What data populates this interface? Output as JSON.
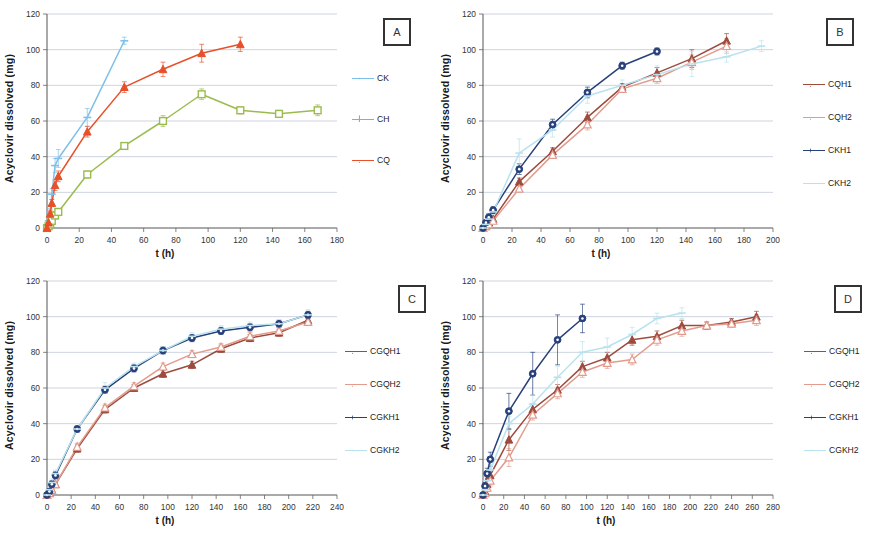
{
  "figure": {
    "axis_label_y": "Acyclovir dissolved (mg)",
    "axis_label_x": "t (h)",
    "ylim": [
      0,
      120
    ],
    "yticks": [
      0,
      20,
      40,
      60,
      80,
      100,
      120
    ]
  },
  "panels": [
    {
      "badge": "A",
      "xlim": [
        0,
        180
      ],
      "xticks": [
        0,
        20,
        40,
        60,
        80,
        100,
        120,
        140,
        160,
        180
      ]
    },
    {
      "badge": "B",
      "xlim": [
        0,
        200
      ],
      "xticks": [
        0,
        20,
        40,
        60,
        80,
        100,
        120,
        140,
        160,
        180,
        200
      ]
    },
    {
      "badge": "C",
      "xlim": [
        0,
        240
      ],
      "xticks": [
        0,
        20,
        40,
        60,
        80,
        100,
        120,
        140,
        160,
        180,
        200,
        220,
        240
      ]
    },
    {
      "badge": "D",
      "xlim": [
        0,
        280
      ],
      "xticks": [
        0,
        20,
        40,
        60,
        80,
        100,
        120,
        140,
        160,
        180,
        200,
        220,
        240,
        260,
        280
      ]
    }
  ],
  "colors": {
    "CK": "#7ec0e8",
    "CH": "#9bbb4e",
    "CQ": "#e8502a",
    "H1_red": "#9e4b3e",
    "H2_red": "#e29b8c",
    "K1_blue": "#28417a",
    "K2_blue": "#b9e2ef"
  },
  "chart_data": [
    {
      "type": "line",
      "panel": "A",
      "title": "",
      "xlabel": "t (h)",
      "ylabel": "Acyclovir dissolved (mg)",
      "xlim": [
        0,
        180
      ],
      "ylim": [
        0,
        120
      ],
      "grid": true,
      "legend_position": "right",
      "series": [
        {
          "name": "CK",
          "color": "#7ec0e8",
          "marker": "dash",
          "x": [
            0,
            1,
            2,
            3,
            5,
            7,
            25,
            48
          ],
          "y": [
            0,
            4,
            9,
            19,
            35,
            39,
            62,
            105
          ],
          "err": [
            0,
            1,
            2,
            3,
            4,
            5,
            5,
            2
          ]
        },
        {
          "name": "CH",
          "color": "#9bbb4e",
          "marker": "square",
          "x": [
            0,
            1,
            2,
            3,
            5,
            7,
            25,
            48,
            72,
            96,
            120,
            144,
            168
          ],
          "y": [
            0,
            1,
            2,
            4,
            7,
            9,
            30,
            46,
            60,
            75,
            66,
            64,
            66
          ],
          "err": [
            0,
            1,
            1,
            1,
            2,
            2,
            2,
            2,
            3,
            3,
            2,
            2,
            3
          ]
        },
        {
          "name": "CQ",
          "color": "#e8502a",
          "marker": "triangle",
          "x": [
            0,
            1,
            2,
            3,
            5,
            7,
            25,
            48,
            72,
            96,
            120
          ],
          "y": [
            0,
            3,
            8,
            14,
            24,
            29,
            54,
            79,
            89,
            98,
            103
          ],
          "err": [
            0,
            1,
            2,
            2,
            3,
            3,
            3,
            3,
            4,
            5,
            4
          ]
        }
      ]
    },
    {
      "type": "line",
      "panel": "B",
      "title": "",
      "xlabel": "t (h)",
      "ylabel": "Acyclovir dissolved (mg)",
      "xlim": [
        0,
        200
      ],
      "ylim": [
        0,
        120
      ],
      "grid": true,
      "legend_position": "right",
      "series": [
        {
          "name": "CQH1",
          "color": "#9e4b3e",
          "marker": "triangle",
          "x": [
            0,
            2,
            4,
            7,
            25,
            48,
            72,
            96,
            120,
            144,
            168
          ],
          "y": [
            0,
            1,
            3,
            5,
            26,
            43,
            62,
            79,
            87,
            95,
            105
          ],
          "err": [
            0,
            1,
            1,
            1,
            2,
            2,
            3,
            2,
            3,
            5,
            4
          ]
        },
        {
          "name": "CQH2",
          "color": "#e29b8c",
          "marker": "triangle-open",
          "x": [
            0,
            2,
            4,
            7,
            25,
            48,
            72,
            96,
            120,
            144,
            168
          ],
          "y": [
            0,
            1,
            2,
            4,
            22,
            41,
            58,
            78,
            84,
            93,
            102
          ],
          "err": [
            0,
            1,
            1,
            1,
            2,
            2,
            3,
            2,
            3,
            4,
            4
          ]
        },
        {
          "name": "CKH1",
          "color": "#28417a",
          "marker": "circle",
          "x": [
            0,
            2,
            4,
            7,
            25,
            48,
            72,
            96,
            120
          ],
          "y": [
            0,
            3,
            6,
            10,
            33,
            58,
            76,
            91,
            99
          ],
          "err": [
            0,
            1,
            2,
            2,
            3,
            3,
            3,
            2,
            2
          ]
        },
        {
          "name": "CKH2",
          "color": "#b9e2ef",
          "marker": "dash",
          "x": [
            0,
            2,
            4,
            7,
            25,
            48,
            72,
            96,
            120,
            144,
            168,
            192
          ],
          "y": [
            0,
            2,
            5,
            9,
            42,
            55,
            74,
            80,
            86,
            92,
            96,
            102
          ],
          "err": [
            0,
            1,
            2,
            2,
            8,
            4,
            4,
            3,
            5,
            7,
            3,
            3
          ]
        }
      ]
    },
    {
      "type": "line",
      "panel": "C",
      "title": "",
      "xlabel": "t (h)",
      "ylabel": "Acyclovir dissolved (mg)",
      "xlim": [
        0,
        240
      ],
      "ylim": [
        0,
        120
      ],
      "grid": true,
      "legend_position": "right",
      "series": [
        {
          "name": "CGQH1",
          "color": "#9e4b3e",
          "marker": "triangle",
          "x": [
            0,
            2,
            4,
            7,
            25,
            48,
            72,
            96,
            120,
            144,
            168,
            192,
            216
          ],
          "y": [
            0,
            1,
            3,
            6,
            26,
            48,
            60,
            68,
            73,
            82,
            88,
            91,
            98
          ],
          "err": [
            0,
            1,
            1,
            1,
            2,
            2,
            2,
            2,
            2,
            2,
            2,
            2,
            2
          ]
        },
        {
          "name": "CGQH2",
          "color": "#e29b8c",
          "marker": "triangle-open",
          "x": [
            0,
            2,
            4,
            7,
            25,
            48,
            72,
            96,
            120,
            144,
            168,
            192,
            216
          ],
          "y": [
            0,
            1,
            3,
            6,
            27,
            49,
            61,
            72,
            79,
            83,
            89,
            92,
            97
          ],
          "err": [
            0,
            1,
            1,
            1,
            2,
            2,
            2,
            2,
            2,
            2,
            2,
            2,
            2
          ]
        },
        {
          "name": "CGKH1",
          "color": "#28417a",
          "marker": "circle",
          "x": [
            0,
            2,
            4,
            7,
            25,
            48,
            72,
            96,
            120,
            144,
            168,
            192,
            216
          ],
          "y": [
            0,
            2,
            6,
            11,
            37,
            59,
            71,
            81,
            88,
            92,
            94,
            96,
            101
          ],
          "err": [
            0,
            1,
            2,
            2,
            2,
            2,
            2,
            2,
            2,
            2,
            2,
            2,
            2
          ]
        },
        {
          "name": "CGKH2",
          "color": "#b9e2ef",
          "marker": "dash",
          "x": [
            0,
            2,
            4,
            7,
            25,
            48,
            72,
            96,
            120,
            144,
            168,
            192,
            216
          ],
          "y": [
            0,
            3,
            7,
            12,
            37,
            60,
            72,
            81,
            89,
            93,
            95,
            96,
            101
          ],
          "err": [
            0,
            1,
            2,
            2,
            2,
            3,
            2,
            2,
            2,
            2,
            2,
            2,
            3
          ]
        }
      ]
    },
    {
      "type": "line",
      "panel": "D",
      "title": "",
      "xlabel": "t (h)",
      "ylabel": "Acyclovir dissolved (mg)",
      "xlim": [
        0,
        280
      ],
      "ylim": [
        0,
        120
      ],
      "grid": true,
      "legend_position": "right",
      "series": [
        {
          "name": "CGQH1",
          "color": "#9e4b3e",
          "marker": "triangle",
          "x": [
            0,
            2,
            4,
            7,
            25,
            48,
            72,
            96,
            120,
            144,
            168,
            192,
            216,
            240,
            264
          ],
          "y": [
            0,
            2,
            6,
            11,
            31,
            48,
            59,
            72,
            77,
            87,
            89,
            95,
            95,
            97,
            100
          ],
          "err": [
            0,
            1,
            2,
            3,
            6,
            3,
            3,
            3,
            3,
            3,
            3,
            3,
            2,
            2,
            3
          ]
        },
        {
          "name": "CGQH2",
          "color": "#e29b8c",
          "marker": "triangle-open",
          "x": [
            0,
            2,
            4,
            7,
            25,
            48,
            72,
            96,
            120,
            144,
            168,
            192,
            216,
            240,
            264
          ],
          "y": [
            0,
            1,
            4,
            8,
            21,
            45,
            57,
            69,
            74,
            76,
            87,
            92,
            95,
            96,
            98
          ],
          "err": [
            0,
            1,
            2,
            3,
            5,
            3,
            3,
            3,
            3,
            3,
            3,
            3,
            2,
            2,
            3
          ]
        },
        {
          "name": "CGKH1",
          "color": "#28417a",
          "marker": "circle",
          "x": [
            0,
            2,
            4,
            7,
            25,
            48,
            72,
            96
          ],
          "y": [
            0,
            5,
            12,
            20,
            47,
            68,
            87,
            99
          ],
          "err": [
            0,
            2,
            3,
            4,
            10,
            12,
            14,
            8
          ]
        },
        {
          "name": "CGKH2",
          "color": "#b9e2ef",
          "marker": "dash",
          "x": [
            0,
            2,
            4,
            7,
            25,
            48,
            72,
            96,
            120,
            144,
            168,
            192
          ],
          "y": [
            0,
            3,
            8,
            14,
            40,
            51,
            66,
            80,
            83,
            90,
            99,
            102
          ],
          "err": [
            0,
            1,
            2,
            3,
            4,
            5,
            6,
            6,
            5,
            4,
            3,
            3
          ]
        }
      ]
    }
  ]
}
